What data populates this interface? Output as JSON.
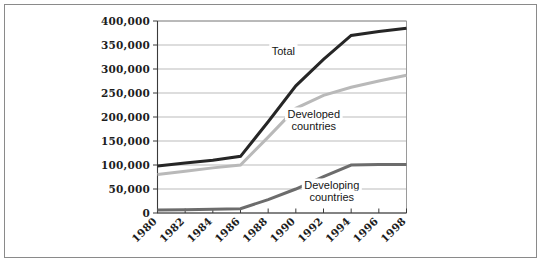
{
  "figure": {
    "frame_color": "#8a8a8a",
    "background": "#ffffff"
  },
  "chart_data": {
    "type": "line",
    "title": "",
    "subtitle": "",
    "xlabel": "",
    "ylabel": "",
    "grid": "horizontal",
    "legend_position": "inline-annotations",
    "x": [
      1980,
      1982,
      1984,
      1986,
      1988,
      1990,
      1992,
      1994,
      1996,
      1998
    ],
    "xtick_labels": [
      "1980",
      "1982",
      "1984",
      "1986",
      "1988",
      "1990",
      "1992",
      "1994",
      "1996",
      "1998"
    ],
    "xtick_rotation": -45,
    "xlim": [
      1980,
      1998
    ],
    "ylim": [
      0,
      400000
    ],
    "ytick_values": [
      0,
      50000,
      100000,
      150000,
      200000,
      250000,
      300000,
      350000,
      400000
    ],
    "ytick_labels": [
      "0",
      "50,000",
      "100,000",
      "150,000",
      "200,000",
      "250,000",
      "300,000",
      "350,000",
      "400,000"
    ],
    "series": [
      {
        "name": "Total",
        "color": "#262626",
        "width": 3.0,
        "label": "Total",
        "label_x": 1989.1,
        "label_y": 330000,
        "values": [
          98000,
          104000,
          110000,
          118000,
          190000,
          265000,
          320000,
          370000,
          378000,
          385000
        ]
      },
      {
        "name": "Developed countries",
        "color": "#b9b9b9",
        "width": 3.0,
        "label": "Developed\ncountries",
        "label_line1": "Developed",
        "label_line2": "countries",
        "label_x": 1991.3,
        "label_y": 198000,
        "values": [
          80000,
          87000,
          94000,
          100000,
          158000,
          218000,
          245000,
          262000,
          275000,
          287000
        ]
      },
      {
        "name": "Developing countries",
        "color": "#6c6c6c",
        "width": 3.0,
        "label": "Developing\ncountries",
        "label_line1": "Developing",
        "label_line2": "countries",
        "label_x": 1992.6,
        "label_y": 50000,
        "values": [
          6000,
          7000,
          8000,
          9000,
          28000,
          50000,
          76000,
          100000,
          101000,
          101000
        ]
      }
    ]
  }
}
